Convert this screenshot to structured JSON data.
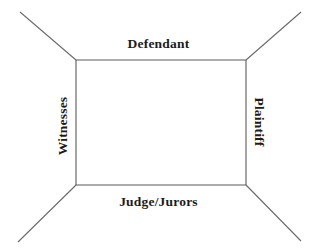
{
  "diagram": {
    "type": "perspective-box",
    "background_color": "#ffffff",
    "line_color": "#5a5a5a",
    "text_color": "#1c1c1c",
    "labels": {
      "top": "Defendant",
      "bottom": "Judge/Jurors",
      "left": "Witnesses",
      "right": "Plaintiff"
    },
    "box": {
      "left": 76,
      "top": 60,
      "right": 246,
      "bottom": 185
    },
    "diagonals": [
      {
        "name": "top-left-diagonal",
        "x1": 76,
        "y1": 60,
        "x2": 20,
        "y2": 12
      },
      {
        "name": "top-right-diagonal",
        "x1": 246,
        "y1": 60,
        "x2": 301,
        "y2": 12
      },
      {
        "name": "bottom-left-diagonal",
        "x1": 76,
        "y1": 185,
        "x2": 18,
        "y2": 242
      },
      {
        "name": "bottom-right-diagonal",
        "x1": 246,
        "y1": 185,
        "x2": 301,
        "y2": 241
      }
    ]
  }
}
